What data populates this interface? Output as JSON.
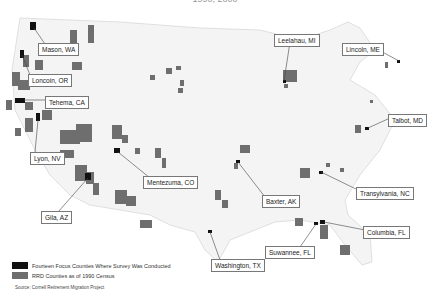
{
  "title": "1990, 2000",
  "colors": {
    "focus": "#111111",
    "rrd": "#6e6e6e",
    "land": "#f4f4f4",
    "border": "#d8d8d8"
  },
  "labels": [
    {
      "text": "Mason, WA",
      "x": 38,
      "y": 43
    },
    {
      "text": "Loncoin, OR",
      "x": 28,
      "y": 74
    },
    {
      "text": "Tehema, CA",
      "x": 45,
      "y": 96
    },
    {
      "text": "Lyon, NV",
      "x": 30,
      "y": 152
    },
    {
      "text": "Gila, AZ",
      "x": 41,
      "y": 211
    },
    {
      "text": "Mentezuma, CO",
      "x": 143,
      "y": 176
    },
    {
      "text": "Leelahau, MI",
      "x": 274,
      "y": 34
    },
    {
      "text": "Lincoln, ME",
      "x": 342,
      "y": 43
    },
    {
      "text": "Talbot, MD",
      "x": 388,
      "y": 114
    },
    {
      "text": "Baxter, AK",
      "x": 262,
      "y": 195
    },
    {
      "text": "Transylvania, NC",
      "x": 356,
      "y": 187
    },
    {
      "text": "Columbia, FL",
      "x": 363,
      "y": 226
    },
    {
      "text": "Suwannee, FL",
      "x": 265,
      "y": 246
    },
    {
      "text": "Washington, TX",
      "x": 211,
      "y": 259
    }
  ],
  "legend": {
    "items": [
      {
        "label": "Fourteen Focus Counties Where Survey Was Conducted",
        "color": "#111111"
      },
      {
        "label": "RRD Counties as of 1990 Census",
        "color": "#6e6e6e"
      }
    ],
    "source": "Source: Cornell Retirement Migration Project"
  }
}
